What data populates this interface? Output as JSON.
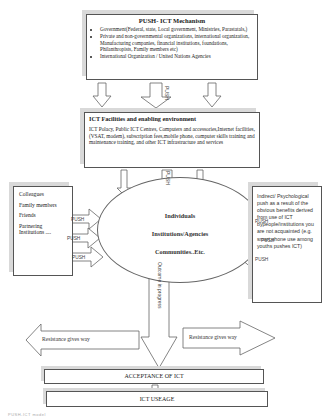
{
  "push_mechanism": {
    "title": "PUSH- ICT Mechanism",
    "items": [
      "Government(Federal, state, Local government, Ministries, Parastatals,)",
      "Private  and non-governmental organizations, international organization, Manufacturing companies, financial institutions, foundations, Philanthropists, Family members etc)",
      "International Organization / United Nations Agencies"
    ]
  },
  "facilities": {
    "title": "ICT Facilities and enabling environment",
    "text": "ICT Polacy, Public ICT Centres, Computers and accessories,Internet facilities,(VSAT, modem), subscription fees,mobile phone, computer skills training and maintenance training, and other ICT infrastructure and services"
  },
  "left_sources": {
    "items": [
      "Colleagues",
      "Family members",
      "Friends",
      "Partnering Institutions ...."
    ]
  },
  "right_source": {
    "text": "Indirect/ Psychological push as a result of the obvious benefits derived from use of ICT bypeople/institutions you are not acquainted (e.g. smart phone use among youths pushes ICT)"
  },
  "center": {
    "lines": [
      "Individuals",
      "Institutions/Agencies",
      "Communities..Etc."
    ]
  },
  "arrows": {
    "push_label": "PUSH",
    "outcome_label": "Outcome in progress",
    "resistance_left": "Resistance gives way",
    "resistance_right": "Resistance gives way"
  },
  "acceptance": {
    "label": "ACCEPTANCE OF ICT"
  },
  "usage": {
    "label": "ICT USEAGE"
  },
  "caption": {
    "text": "PUSH-ICT model"
  }
}
